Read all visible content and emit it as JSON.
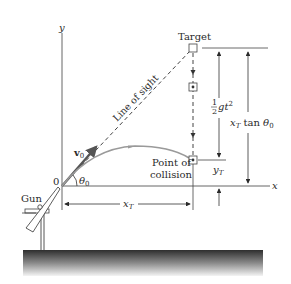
{
  "diagram": {
    "labels": {
      "y_axis": "y",
      "x_axis": "x",
      "origin": "0",
      "target": "Target",
      "line_of_sight": "Line of sight",
      "velocity": "v",
      "velocity_sub": "0",
      "angle": "θ",
      "angle_sub": "0",
      "gun": "Gun",
      "collision_line1": "Point of",
      "collision_line2": "collision",
      "xT_main": "x",
      "xT_sub": "T",
      "yT_main": "y",
      "yT_sub": "T",
      "half_num": "1",
      "half_den": "2",
      "gt2": "gt",
      "gt2_sup": "2",
      "xT_tan": "x",
      "xT_tan_sub": "T",
      "tan": " tan ",
      "theta0": "θ",
      "theta0_sub": "0"
    },
    "colors": {
      "axis": "#555555",
      "trajectory": "#9a9a9a",
      "ink": "#2a2a2a",
      "ground_top": "#333333",
      "ground_bottom": "#f0f0f0"
    }
  }
}
